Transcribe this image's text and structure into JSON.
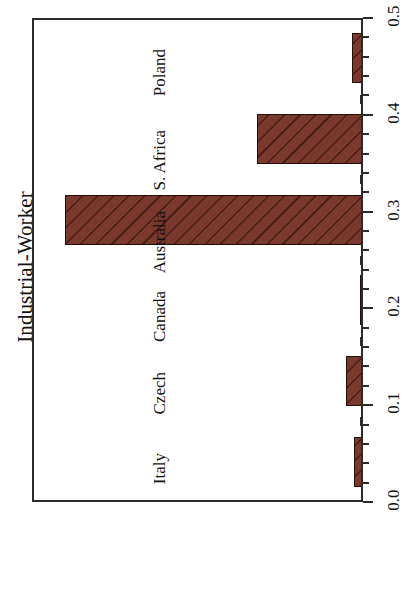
{
  "chart_data": {
    "type": "bar",
    "title": "Industrial-Worker",
    "orientation": "vertical-rotated-90",
    "xlabel": "",
    "ylabel": "Industrial-Worker",
    "categories": [
      "Poland",
      "S. Africa",
      "Australia",
      "Canada",
      "Czech",
      "Italy"
    ],
    "values": [
      0.016,
      0.16,
      0.45,
      0.005,
      0.025,
      0.013
    ],
    "ylim": [
      0.0,
      0.5
    ],
    "ytick_labels": [
      "0.0",
      "0.1",
      "0.2",
      "0.3",
      "0.4",
      "0.5"
    ],
    "ytick_values": [
      0.0,
      0.1,
      0.2,
      0.3,
      0.4,
      0.5
    ],
    "minor_tick_step": 0.02,
    "grid": false,
    "legend": null,
    "bar_fill_color": "#7a392c",
    "bar_edge_color": "#221008",
    "bar_hatch": "diagonal",
    "axis_color": "#2b2b2b",
    "background_color": "#ffffff"
  }
}
